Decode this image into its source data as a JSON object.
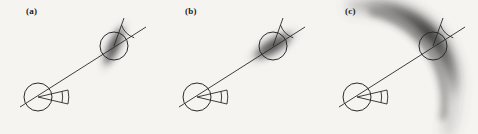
{
  "figure": {
    "background_color": "#f6f4f1",
    "ink_color": "#2a2a2a",
    "blob_color": "#4a4a4a",
    "width": 478,
    "height": 134,
    "panel_count": 3
  },
  "panels": [
    {
      "id": "a",
      "label": "(a)",
      "blob_shape": "ellipse",
      "blob_description": "elongated diffuse ellipse tilted steeply, oriented across the beam line",
      "blob": {
        "cx": 114,
        "cy": 46,
        "rx": 10,
        "ry": 34,
        "rotation_deg": 25,
        "core_gray": "#4f4f4f"
      },
      "source_circle": {
        "cx": 38,
        "cy": 97,
        "r": 14
      },
      "detector_circle": {
        "cx": 114,
        "cy": 46,
        "r": 14
      },
      "beam_line": {
        "x1": 20,
        "y1": 107,
        "x2": 146,
        "y2": 27
      },
      "source_wedge": {
        "apex_x": 38,
        "apex_y": 97,
        "half_angle_deg": 13,
        "length": 30,
        "direction_deg": 0
      },
      "detector_reference_line": {
        "x1": 114,
        "y1": 46,
        "x2": 124,
        "y2": 18
      },
      "detector_arc_radius": 21
    },
    {
      "id": "b",
      "label": "(b)",
      "blob_shape": "ellipse",
      "blob_description": "elongated diffuse ellipse aligned along the beam line direction",
      "blob": {
        "cx": 114,
        "cy": 46,
        "rx": 36,
        "ry": 13,
        "rotation_deg": -32,
        "core_gray": "#4f4f4f"
      },
      "source_circle": {
        "cx": 38,
        "cy": 97,
        "r": 14
      },
      "detector_circle": {
        "cx": 114,
        "cy": 46,
        "r": 14
      },
      "beam_line": {
        "x1": 20,
        "y1": 107,
        "x2": 146,
        "y2": 27
      },
      "source_wedge": {
        "apex_x": 38,
        "apex_y": 97,
        "half_angle_deg": 13,
        "length": 30,
        "direction_deg": 0
      },
      "detector_reference_line": {
        "x1": 114,
        "y1": 46,
        "x2": 124,
        "y2": 18
      },
      "detector_arc_radius": 21
    },
    {
      "id": "c",
      "label": "(c)",
      "blob_shape": "arc",
      "blob_description": "curved crescent banana-shaped diffuse arc sweeping from upper-left through the detector down to lower-right",
      "blob": {
        "arc_cx": 38,
        "arc_cy": 97,
        "arc_radius": 92,
        "start_angle_deg": -140,
        "end_angle_deg": -5,
        "thickness": 13,
        "core_gray": "#4f4f4f"
      },
      "source_circle": {
        "cx": 38,
        "cy": 97,
        "r": 14
      },
      "detector_circle": {
        "cx": 114,
        "cy": 46,
        "r": 14
      },
      "beam_line": {
        "x1": 20,
        "y1": 107,
        "x2": 146,
        "y2": 27
      },
      "source_wedge": {
        "apex_x": 38,
        "apex_y": 97,
        "half_angle_deg": 13,
        "length": 30,
        "direction_deg": 0
      },
      "detector_reference_line": {
        "x1": 114,
        "y1": 46,
        "x2": 124,
        "y2": 18
      },
      "detector_arc_radius": 21
    }
  ]
}
